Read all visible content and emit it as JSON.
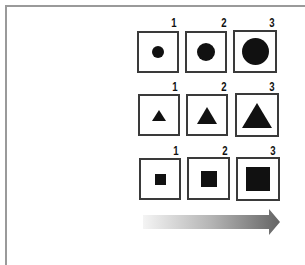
{
  "diagram": {
    "title": "",
    "rows": [
      {
        "shape": "circle",
        "items": [
          {
            "label": "1",
            "size": 12
          },
          {
            "label": "2",
            "size": 18
          },
          {
            "label": "3",
            "size": 27
          }
        ]
      },
      {
        "shape": "triangle",
        "items": [
          {
            "label": "1",
            "size": 14
          },
          {
            "label": "2",
            "size": 21
          },
          {
            "label": "3",
            "size": 30
          }
        ]
      },
      {
        "shape": "square",
        "items": [
          {
            "label": "1",
            "size": 11
          },
          {
            "label": "2",
            "size": 16
          },
          {
            "label": "3",
            "size": 24
          }
        ]
      }
    ],
    "arrow": {
      "direction": "right",
      "gradient_start": "#f2f2f2",
      "gradient_end": "#6a6a6a"
    },
    "colors": {
      "shape_fill": "#111111",
      "box_border": "#3a3a3a",
      "frame_border": "#9a9a9a"
    }
  }
}
